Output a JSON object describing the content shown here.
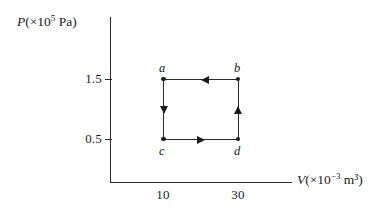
{
  "chart_data": {
    "type": "line",
    "title": "",
    "xlabel": "V (×10⁻³ m³)",
    "ylabel": "P (×10⁵ Pa)",
    "x_axis": {
      "label_var": "V",
      "label_units": "(×10",
      "label_exponent": "−3",
      "label_tail": " m³)",
      "ticks": [
        "10",
        "30"
      ],
      "tick_values": [
        10,
        30
      ],
      "grid": false
    },
    "y_axis": {
      "label_var": "P",
      "label_units": "(×10",
      "label_exponent": "5",
      "label_tail": " Pa)",
      "ticks": [
        "1.5",
        "0.5"
      ],
      "tick_values": [
        1.5,
        0.5
      ],
      "grid": false
    },
    "points": [
      {
        "id": "a",
        "label": "a",
        "V": 10,
        "P": 1.5
      },
      {
        "id": "b",
        "label": "b",
        "V": 30,
        "P": 1.5
      },
      {
        "id": "c",
        "label": "c",
        "V": 10,
        "P": 0.5
      },
      {
        "id": "d",
        "label": "d",
        "V": 30,
        "P": 0.5
      }
    ],
    "processes": [
      {
        "from": "b",
        "to": "a",
        "direction": "left",
        "type": "isobaric",
        "P": 1.5
      },
      {
        "from": "a",
        "to": "c",
        "direction": "down",
        "type": "isochoric",
        "V": 10
      },
      {
        "from": "c",
        "to": "d",
        "direction": "right",
        "type": "isobaric",
        "P": 0.5
      },
      {
        "from": "d",
        "to": "b",
        "direction": "up",
        "type": "isochoric",
        "V": 30
      }
    ],
    "legend": [],
    "annotations": []
  },
  "labels": {
    "a": "a",
    "b": "b",
    "c": "c",
    "d": "d",
    "y_tick_15": "1.5",
    "y_tick_05": "0.5",
    "x_tick_10": "10",
    "x_tick_30": "30"
  },
  "colors": {
    "ink": "#1a1a1a",
    "axis": "#2a2a2a",
    "background": "#ffffff"
  }
}
